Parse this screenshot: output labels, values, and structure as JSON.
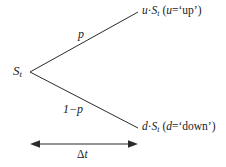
{
  "diagram": {
    "type": "one-step-binomial-tree",
    "root": {
      "symbol": "S",
      "subscript": "t"
    },
    "branches": [
      {
        "id": "up",
        "probability_label": "p",
        "node_prefix": "u",
        "node_symbol": "S",
        "node_subscript": "t",
        "node_dot": "·",
        "annotation_open": "(",
        "annotation_var": "u",
        "annotation_eq": "=",
        "annotation_value": "‘up’",
        "annotation_close": ")",
        "from": [
          30,
          72
        ],
        "to": [
          138,
          12
        ]
      },
      {
        "id": "down",
        "probability_label": "1−p",
        "node_prefix": "d",
        "node_symbol": "S",
        "node_subscript": "t",
        "node_dot": "·",
        "annotation_open": "(",
        "annotation_var": "d",
        "annotation_eq": "=",
        "annotation_value": "‘down’",
        "annotation_close": ")",
        "from": [
          30,
          72
        ],
        "to": [
          138,
          128
        ]
      }
    ],
    "time_axis": {
      "label_delta": "Δ",
      "label_var": "t",
      "from_x": 31,
      "to_x": 138,
      "y": 144
    },
    "colors": {
      "line": "#2b2b2b",
      "text": "#1a1a1a",
      "background": "#ffffff"
    }
  }
}
